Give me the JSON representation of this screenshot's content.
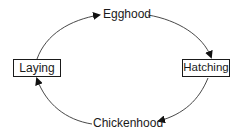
{
  "diagram": {
    "type": "cycle",
    "nodes": [
      {
        "id": "egghood",
        "label": "Egghood",
        "shape": "text"
      },
      {
        "id": "hatching",
        "label": "Hatching",
        "shape": "box"
      },
      {
        "id": "chickenhood",
        "label": "Chickenhood",
        "shape": "text"
      },
      {
        "id": "laying",
        "label": "Laying",
        "shape": "box"
      }
    ],
    "edges": [
      {
        "from": "laying",
        "to": "egghood"
      },
      {
        "from": "egghood",
        "to": "hatching"
      },
      {
        "from": "hatching",
        "to": "chickenhood"
      },
      {
        "from": "chickenhood",
        "to": "laying"
      }
    ],
    "colors": {
      "line": "#333333",
      "text": "#1a1a1a",
      "background": "#ffffff"
    }
  }
}
